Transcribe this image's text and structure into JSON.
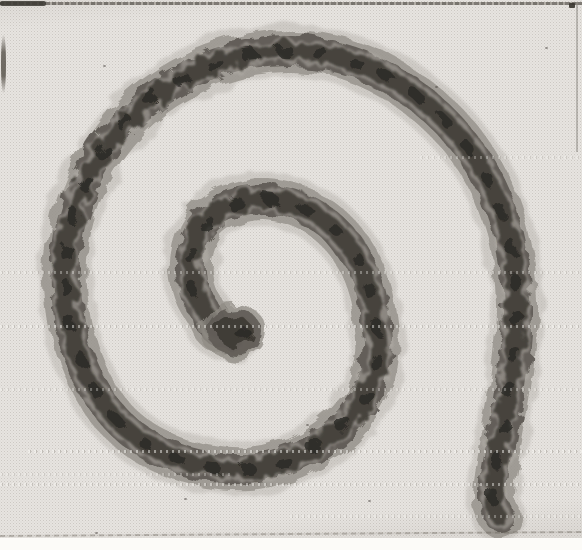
{
  "figure": {
    "kind": "halftone-photograph-plate",
    "colors": {
      "paper": "#fcfbf8",
      "plate_background": "#e7e4e0",
      "rope_halo": "#b7b3ad",
      "rope_body": "#918d86",
      "rope_core": "#5d5953",
      "rope_dark": "#3a3731",
      "rope_knot": "#2c2a26",
      "groove_light": "#b5b1aa"
    },
    "rope": {
      "centerline": [
        [
          234,
          334
        ],
        [
          216,
          330
        ],
        [
          208,
          316
        ],
        [
          196,
          296
        ],
        [
          190,
          272
        ],
        [
          192,
          248
        ],
        [
          201,
          227
        ],
        [
          218,
          211
        ],
        [
          240,
          202
        ],
        [
          265,
          199
        ],
        [
          292,
          204
        ],
        [
          318,
          216
        ],
        [
          340,
          235
        ],
        [
          358,
          260
        ],
        [
          370,
          290
        ],
        [
          376,
          322
        ],
        [
          378,
          356
        ],
        [
          368,
          392
        ],
        [
          348,
          421
        ],
        [
          320,
          444
        ],
        [
          286,
          461
        ],
        [
          248,
          469
        ],
        [
          206,
          466
        ],
        [
          168,
          455
        ],
        [
          136,
          437
        ],
        [
          108,
          410
        ],
        [
          88,
          377
        ],
        [
          74,
          340
        ],
        [
          67,
          300
        ],
        [
          66,
          260
        ],
        [
          73,
          218
        ],
        [
          88,
          177
        ],
        [
          110,
          141
        ],
        [
          139,
          109
        ],
        [
          173,
          84
        ],
        [
          212,
          65
        ],
        [
          252,
          54
        ],
        [
          292,
          51
        ],
        [
          332,
          56
        ],
        [
          371,
          69
        ],
        [
          408,
          90
        ],
        [
          441,
          117
        ],
        [
          469,
          149
        ],
        [
          491,
          186
        ],
        [
          506,
          226
        ],
        [
          514,
          266
        ],
        [
          517,
          304
        ],
        [
          515,
          344
        ],
        [
          510,
          386
        ],
        [
          503,
          428
        ],
        [
          496,
          468
        ],
        [
          493,
          499
        ],
        [
          500,
          517
        ]
      ],
      "layers": [
        {
          "name": "halo",
          "width": 54,
          "color": "#b7b3ad",
          "opacity": 0.5,
          "dash": "",
          "offset": 0,
          "filter": "fuzz"
        },
        {
          "name": "body",
          "width": 42,
          "color": "#918d86",
          "opacity": 0.75,
          "dash": "",
          "offset": 0,
          "filter": "rough1"
        },
        {
          "name": "core",
          "width": 30,
          "color": "#5d5953",
          "opacity": 0.9,
          "dash": "",
          "offset": 0,
          "filter": "rough2"
        },
        {
          "name": "groove-light",
          "width": 26,
          "color": "#b5b1aa",
          "opacity": 0.5,
          "dash": "5 16",
          "offset": 3,
          "filter": "rough3"
        },
        {
          "name": "braid-dark",
          "width": 18,
          "color": "#3a3731",
          "opacity": 0.85,
          "dash": "13 9",
          "offset": 0,
          "filter": "rough3"
        },
        {
          "name": "knots",
          "width": 10,
          "color": "#2c2a26",
          "opacity": 0.8,
          "dash": "7 29",
          "offset": 11,
          "filter": "rough2"
        }
      ]
    },
    "inner_knob": {
      "cx": 233,
      "cy": 331,
      "layers": [
        {
          "rx": 33,
          "ry": 28,
          "dx": 0,
          "dy": 0,
          "fill": "#8f8b84",
          "opacity": 0.75
        },
        {
          "rx": 27,
          "ry": 23,
          "dx": 1,
          "dy": 0,
          "fill": "#5d5953",
          "opacity": 0.85
        },
        {
          "rx": 18,
          "ry": 15,
          "dx": 2,
          "dy": 1,
          "fill": "#3a3731",
          "opacity": 0.85
        },
        {
          "rx": 8,
          "ry": 6,
          "dx": 10,
          "dy": 2,
          "fill": "#2c2a26",
          "opacity": 0.85
        }
      ]
    },
    "print_artifacts": {
      "bands": [
        {
          "y": 156,
          "x": 420,
          "w": 162,
          "opacity": 0.3
        },
        {
          "y": 271,
          "x": 0,
          "w": 582,
          "opacity": 0.35
        },
        {
          "y": 325,
          "x": 0,
          "w": 582,
          "opacity": 0.45
        },
        {
          "y": 388,
          "x": 0,
          "w": 582,
          "opacity": 0.32
        },
        {
          "y": 450,
          "x": 28,
          "w": 554,
          "opacity": 0.5
        },
        {
          "y": 473,
          "x": 0,
          "w": 230,
          "opacity": 0.3
        },
        {
          "y": 483,
          "x": 0,
          "w": 582,
          "opacity": 0.45
        },
        {
          "y": 515,
          "x": 290,
          "w": 292,
          "opacity": 0.32
        }
      ],
      "specks": [
        {
          "x": 545,
          "y": 47
        },
        {
          "x": 103,
          "y": 65
        },
        {
          "x": 184,
          "y": 498
        },
        {
          "x": 306,
          "y": 424
        },
        {
          "x": 368,
          "y": 500
        },
        {
          "x": 95,
          "y": 532
        },
        {
          "x": 435,
          "y": 86
        }
      ]
    }
  }
}
